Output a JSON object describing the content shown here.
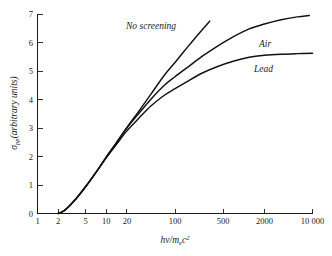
{
  "chart_data": {
    "type": "line",
    "title": "",
    "xlabel": "hv/m_e c^2",
    "ylabel": "sigma_pp (arbitrary units)",
    "xscale": "log",
    "xlim": [
      1,
      10000
    ],
    "ylim": [
      0,
      7
    ],
    "grid": false,
    "legend_position": "inline-annotations",
    "xticks": [
      1,
      2,
      5,
      10,
      20,
      100,
      500,
      2000,
      10000
    ],
    "xticklabels": [
      "1",
      "2",
      "5",
      "10",
      "20",
      "100",
      "500",
      "2000",
      "10 000"
    ],
    "yticks": [
      0,
      1,
      2,
      3,
      4,
      5,
      6,
      7
    ],
    "yticklabels": [
      "0",
      "1",
      "2",
      "3",
      "4",
      "5",
      "6",
      "7"
    ],
    "series": [
      {
        "name": "No screening",
        "label": "No screening",
        "color": "#111111",
        "x": [
          2.0,
          2.2,
          2.5,
          3,
          3.5,
          4,
          5,
          6,
          8,
          10,
          14,
          20,
          30,
          45,
          70,
          100,
          150,
          220,
          320,
          450,
          600
        ],
        "y": [
          0.0,
          0.04,
          0.12,
          0.3,
          0.47,
          0.64,
          0.94,
          1.2,
          1.63,
          1.98,
          2.48,
          3.02,
          3.6,
          4.2,
          4.85,
          5.3,
          5.82,
          6.3,
          6.75,
          7.12,
          7.4
        ]
      },
      {
        "name": "Air",
        "label": "Air",
        "color": "#111111",
        "x": [
          2.0,
          2.2,
          2.5,
          3,
          3.5,
          4,
          5,
          6,
          8,
          10,
          14,
          20,
          30,
          45,
          70,
          100,
          150,
          250,
          400,
          700,
          1200,
          2000,
          3500,
          6000,
          9000
        ],
        "y": [
          0.0,
          0.04,
          0.12,
          0.3,
          0.47,
          0.64,
          0.94,
          1.2,
          1.63,
          1.98,
          2.48,
          3.0,
          3.52,
          4.02,
          4.5,
          4.8,
          5.12,
          5.52,
          5.85,
          6.2,
          6.48,
          6.65,
          6.8,
          6.9,
          6.95
        ]
      },
      {
        "name": "Lead",
        "label": "Lead",
        "color": "#111111",
        "x": [
          2.0,
          2.2,
          2.5,
          3,
          3.5,
          4,
          5,
          6,
          8,
          10,
          14,
          20,
          30,
          45,
          70,
          100,
          150,
          250,
          400,
          700,
          1200,
          2000,
          3500,
          6000,
          10000
        ],
        "y": [
          0.0,
          0.04,
          0.12,
          0.3,
          0.47,
          0.64,
          0.94,
          1.2,
          1.62,
          1.95,
          2.42,
          2.9,
          3.35,
          3.78,
          4.15,
          4.38,
          4.63,
          4.93,
          5.14,
          5.34,
          5.48,
          5.55,
          5.59,
          5.61,
          5.62
        ]
      }
    ],
    "annotations": [
      {
        "text": "No screening",
        "x_px": 126,
        "y_px": 29,
        "name": "annotation-no-screening"
      },
      {
        "text": "Air",
        "x_px": 259,
        "y_px": 47,
        "name": "annotation-air"
      },
      {
        "text": "Lead",
        "x_px": 254,
        "y_px": 72,
        "name": "annotation-lead"
      }
    ]
  },
  "axis": {
    "x_label_parts": {
      "h": "h",
      "nu": "v",
      "slash": "/",
      "m": "m",
      "e": "e",
      "c": "c",
      "exp": "2"
    },
    "y_label_parts": {
      "sigma": "σ",
      "sub": "pp",
      "rest": "(arbitrary units)"
    }
  }
}
